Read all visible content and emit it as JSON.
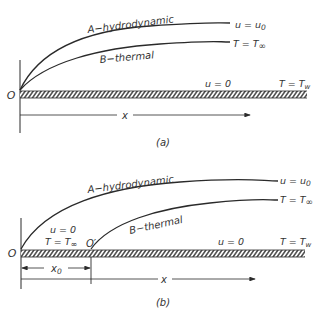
{
  "panel_a": {
    "caption": "(a)",
    "origin_label": "O",
    "curve_a_label": "A−hydrodynamic",
    "curve_b_label": "B−thermal",
    "curve_a_end_label": "u = u",
    "curve_a_end_sub": "0",
    "curve_b_end_label": "T = T",
    "curve_b_end_sub": "∞",
    "wall_velocity_label": "u = 0",
    "wall_temp_label": "T = T",
    "wall_temp_sub": "w",
    "x_axis_label": "x"
  },
  "panel_b": {
    "caption": "(b)",
    "origin_label": "O",
    "origin_prime_label": "O′",
    "curve_a_label": "A−hydrodynamic",
    "curve_b_label": "B−thermal",
    "curve_a_end_label": "u = u",
    "curve_a_end_sub": "0",
    "curve_b_end_label": "T = T",
    "curve_b_end_sub": "∞",
    "unheated_velocity_label": "u = 0",
    "unheated_temp_label": "T = T",
    "unheated_temp_sub": "∞",
    "wall_velocity_label": "u = 0",
    "wall_temp_label": "T = T",
    "wall_temp_sub": "w",
    "x0_label": "x",
    "x0_sub": "0",
    "x_axis_label": "x"
  },
  "colors": {
    "line": "#2a2a2a",
    "text": "#333333",
    "background": "#ffffff"
  }
}
